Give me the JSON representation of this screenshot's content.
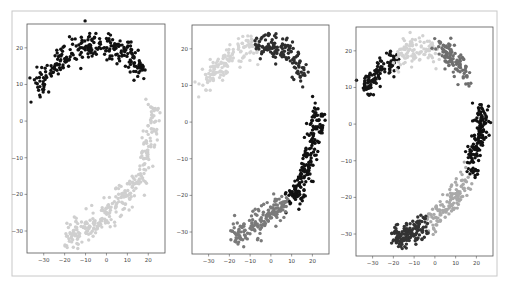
{
  "figure": {
    "frame": {
      "x": 12,
      "y": 11,
      "w": 485,
      "h": 265,
      "stroke": "#c8c8c8"
    },
    "panel_count": 3
  },
  "chart_data": [
    {
      "type": "scatter",
      "title": "",
      "xlabel": "",
      "ylabel": "",
      "xlim": [
        -38,
        28
      ],
      "ylim": [
        -36,
        26.5
      ],
      "xticks": [
        -30,
        -20,
        -10,
        0,
        10,
        20
      ],
      "yticks": [
        20,
        10,
        0,
        -10,
        -20,
        -30
      ],
      "grid": false,
      "legend": null,
      "pixel_box": {
        "x": 27,
        "y": 24,
        "w": 138,
        "h": 229
      },
      "clusters": [
        {
          "name": "cluster-upper-arc",
          "color": "#111111",
          "count": 260,
          "path": [
            [
              -34,
              9.5
            ],
            [
              -30,
              12
            ],
            [
              -25,
              15
            ],
            [
              -20,
              17.5
            ],
            [
              -15,
              19.5
            ],
            [
              -10,
              20.5
            ],
            [
              -5,
              20.5
            ],
            [
              0,
              20
            ],
            [
              5,
              20
            ],
            [
              10,
              18.5
            ],
            [
              14,
              16
            ],
            [
              16,
              14
            ],
            [
              18,
              13
            ]
          ],
          "spread": 1.8
        },
        {
          "name": "cluster-lower-arc",
          "color": "#cfcfcf",
          "count": 300,
          "path": [
            [
              22,
              4
            ],
            [
              23,
              0
            ],
            [
              21,
              -4
            ],
            [
              19,
              -8
            ],
            [
              18,
              -12
            ],
            [
              15,
              -16
            ],
            [
              11,
              -19
            ],
            [
              6,
              -22
            ],
            [
              1,
              -25
            ],
            [
              -4,
              -27
            ],
            [
              -9,
              -29
            ],
            [
              -14,
              -30
            ],
            [
              -19,
              -31.5
            ]
          ],
          "spread": 1.9
        }
      ]
    },
    {
      "type": "scatter",
      "title": "",
      "xlabel": "",
      "ylabel": "",
      "xlim": [
        -38,
        28
      ],
      "ylim": [
        -36,
        26.5
      ],
      "xticks": [
        -30,
        -20,
        -10,
        0,
        10,
        20
      ],
      "yticks": [
        20,
        10,
        0,
        -10,
        -20,
        -30
      ],
      "grid": false,
      "legend": null,
      "pixel_box": {
        "x": 192,
        "y": 25,
        "w": 137,
        "h": 229
      },
      "clusters": [
        {
          "name": "cluster-light-upper-left",
          "color": "#d4d4d4",
          "count": 140,
          "path": [
            [
              -34,
              9.5
            ],
            [
              -30,
              12
            ],
            [
              -25,
              15
            ],
            [
              -20,
              17.5
            ],
            [
              -15,
              19.5
            ],
            [
              -10,
              20.5
            ],
            [
              -7,
              21
            ]
          ],
          "spread": 1.7
        },
        {
          "name": "cluster-dark-upper-right",
          "color": "#2e2e2e",
          "count": 130,
          "path": [
            [
              -7,
              21
            ],
            [
              -3,
              21
            ],
            [
              1,
              20
            ],
            [
              5,
              20
            ],
            [
              9,
              19
            ],
            [
              12,
              17
            ],
            [
              14,
              15
            ],
            [
              16,
              13
            ]
          ],
          "spread": 1.8
        },
        {
          "name": "cluster-black-right-arc",
          "color": "#111111",
          "count": 190,
          "path": [
            [
              22,
              4
            ],
            [
              23,
              0
            ],
            [
              21,
              -4
            ],
            [
              19,
              -8
            ],
            [
              18,
              -12
            ],
            [
              15,
              -16
            ],
            [
              12,
              -19
            ],
            [
              9,
              -21
            ]
          ],
          "spread": 1.8
        },
        {
          "name": "cluster-gray-bottom",
          "color": "#7a7a7a",
          "count": 160,
          "path": [
            [
              7,
              -22
            ],
            [
              3,
              -24
            ],
            [
              -2,
              -26
            ],
            [
              -6,
              -28
            ],
            [
              -10,
              -29
            ],
            [
              -14,
              -30
            ],
            [
              -19,
              -31.5
            ]
          ],
          "spread": 1.8
        }
      ]
    },
    {
      "type": "scatter",
      "title": "",
      "xlabel": "",
      "ylabel": "",
      "xlim": [
        -38,
        28
      ],
      "ylim": [
        -36,
        26.5
      ],
      "xticks": [
        -30,
        -20,
        -10,
        0,
        10,
        20
      ],
      "yticks": [
        20,
        10,
        0,
        -10,
        -20,
        -30
      ],
      "grid": false,
      "legend": null,
      "pixel_box": {
        "x": 356,
        "y": 27,
        "w": 137,
        "h": 229
      },
      "clusters": [
        {
          "name": "cluster-black-upper-left",
          "color": "#151515",
          "count": 110,
          "path": [
            [
              -34,
              9.5
            ],
            [
              -30,
              12
            ],
            [
              -26,
              14.5
            ],
            [
              -22,
              16.5
            ],
            [
              -19,
              18
            ]
          ],
          "spread": 1.5
        },
        {
          "name": "cluster-light-top",
          "color": "#d2d2d2",
          "count": 110,
          "path": [
            [
              -18,
              18.5
            ],
            [
              -14,
              20
            ],
            [
              -10,
              20.5
            ],
            [
              -6,
              20.5
            ],
            [
              -2,
              20
            ],
            [
              1,
              19.5
            ]
          ],
          "spread": 1.8
        },
        {
          "name": "cluster-gray-upper-right",
          "color": "#6e6e6e",
          "count": 110,
          "path": [
            [
              2,
              21
            ],
            [
              5,
              20
            ],
            [
              9,
              18.5
            ],
            [
              12,
              16.5
            ],
            [
              14,
              14.5
            ],
            [
              16,
              13
            ]
          ],
          "spread": 1.7
        },
        {
          "name": "cluster-black-right-arc",
          "color": "#111111",
          "count": 150,
          "path": [
            [
              22,
              4
            ],
            [
              23,
              0
            ],
            [
              21,
              -4
            ],
            [
              19,
              -8
            ],
            [
              18,
              -12
            ]
          ],
          "spread": 1.7
        },
        {
          "name": "cluster-lightgray-lower",
          "color": "#a9a9a9",
          "count": 130,
          "path": [
            [
              15,
              -15
            ],
            [
              12,
              -19
            ],
            [
              8,
              -21
            ],
            [
              4,
              -23
            ],
            [
              0,
              -25
            ],
            [
              -3,
              -26.5
            ]
          ],
          "spread": 1.8
        },
        {
          "name": "cluster-dark-bottom",
          "color": "#333333",
          "count": 140,
          "path": [
            [
              -5,
              -27.5
            ],
            [
              -9,
              -29
            ],
            [
              -13,
              -30
            ],
            [
              -17,
              -31
            ],
            [
              -20,
              -32
            ]
          ],
          "spread": 1.7
        }
      ]
    }
  ]
}
